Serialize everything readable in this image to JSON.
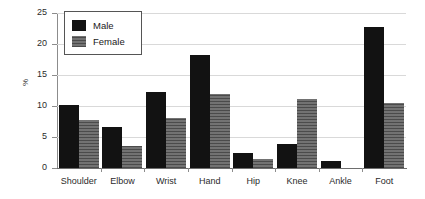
{
  "chart_data": {
    "type": "bar",
    "title": "",
    "subtitle": "",
    "xlabel": "",
    "ylabel": "%",
    "ylim": [
      0,
      25
    ],
    "ytick_values": [
      0,
      5,
      10,
      15,
      20,
      25
    ],
    "ytick_labels": [
      "0",
      "5",
      "10",
      "15",
      "20",
      "25"
    ],
    "grid": true,
    "grid_axis": "y",
    "legend_position": "upper-left-inside",
    "categories": [
      "Shoulder",
      "Elbow",
      "Wrist",
      "Hand",
      "Hip",
      "Knee",
      "Ankle",
      "Foot"
    ],
    "series": [
      {
        "name": "Male",
        "color": "#121212",
        "values": [
          10.1,
          6.6,
          12.2,
          18.2,
          2.5,
          3.9,
          1.1,
          22.7
        ]
      },
      {
        "name": "Female",
        "color": "#6b6b6b",
        "values": [
          7.7,
          3.6,
          8.1,
          12.0,
          1.4,
          11.2,
          0.0,
          10.5
        ]
      }
    ]
  },
  "legend": {
    "items": [
      {
        "label": "Male",
        "swatch": "male-swatch"
      },
      {
        "label": "Female",
        "swatch": "female-swatch"
      }
    ]
  },
  "axes": {
    "y_title": "%"
  }
}
